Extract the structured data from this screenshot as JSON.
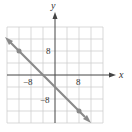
{
  "graph": {
    "axes": {
      "x_label": "x",
      "y_label": "y"
    },
    "ticks": {
      "x_neg": "−8",
      "x_pos": "8",
      "y_pos": "8",
      "y_neg": "−8"
    },
    "range": {
      "xmin": -16,
      "xmax": 16,
      "ymin": -16,
      "ymax": 16,
      "grid_step": 4
    },
    "line": {
      "equation": "y = -x - 4",
      "slope": -1,
      "intercept": -4,
      "color": "#8a8a8a"
    },
    "points": [
      {
        "x": -12,
        "y": 8
      },
      {
        "x": 8,
        "y": -12
      }
    ]
  }
}
